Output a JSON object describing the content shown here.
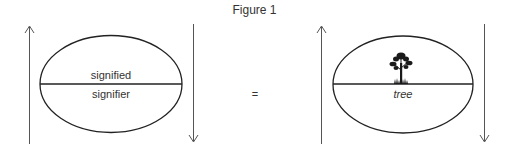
{
  "figure": {
    "caption": "Figure 1",
    "left_sign": {
      "upper_label": "signified",
      "lower_label": "signifier"
    },
    "equals_symbol": "=",
    "right_sign": {
      "upper_content": "tree-icon",
      "lower_label": "tree"
    },
    "arrows": {
      "left_of_sign": "up",
      "right_of_sign": "down"
    },
    "colors": {
      "stroke": "#222222",
      "arrow": "#555555",
      "text": "#333333",
      "background": "#ffffff"
    }
  }
}
